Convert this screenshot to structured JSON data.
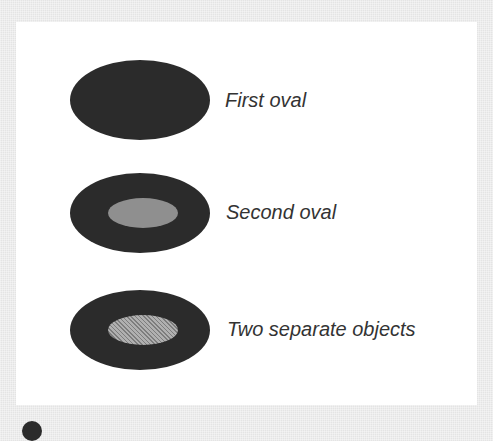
{
  "figure": {
    "background_color": "#e4e4e4",
    "panel_color": "#ffffff",
    "items": [
      {
        "label": "First oval",
        "shape": "oval",
        "outer_color": "#2b2b2b",
        "inner": null
      },
      {
        "label": "Second oval",
        "shape": "oval-with-inner-oval",
        "outer_color": "#2b2b2b",
        "inner": {
          "fill": "solid",
          "color": "#8f8f8f"
        }
      },
      {
        "label": "Two separate objects",
        "shape": "oval-with-inner-oval",
        "outer_color": "#2b2b2b",
        "inner": {
          "fill": "hatched",
          "color": "#9a9a9a"
        }
      }
    ]
  }
}
